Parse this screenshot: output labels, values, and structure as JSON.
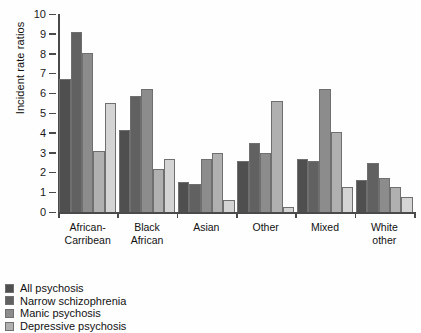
{
  "chart_data": {
    "type": "bar",
    "title": "",
    "subtitle": "",
    "xlabel": "",
    "ylabel": "Incident rate ratios",
    "ylim": [
      0,
      10
    ],
    "ytick_labels": [
      "0",
      "1",
      "2",
      "3",
      "4",
      "5",
      "6",
      "7",
      "8",
      "9",
      "10"
    ],
    "ytick_values": [
      0,
      1,
      2,
      3,
      4,
      5,
      6,
      7,
      8,
      9,
      10
    ],
    "grid": false,
    "legend_position": "below-left",
    "categories": [
      "African-\nCarribean",
      "Black\nAfrican",
      "Asian",
      "Other",
      "Mixed",
      "White\nother"
    ],
    "series": [
      {
        "name": "All psychosis",
        "color": "#4f4f4f",
        "values": [
          6.7,
          4.15,
          1.5,
          2.6,
          2.7,
          1.6
        ]
      },
      {
        "name": "Narrow schizophrenia",
        "color": "#616161",
        "values": [
          9.1,
          5.85,
          1.4,
          3.5,
          2.6,
          2.5
        ]
      },
      {
        "name": "Manic psychosis",
        "color": "#8c8c8c",
        "values": [
          8.05,
          6.2,
          2.7,
          3.0,
          6.2,
          1.7
        ]
      },
      {
        "name": "Depressive psychosis",
        "color": "#b0b0b0",
        "values": [
          3.1,
          2.15,
          3.0,
          5.6,
          4.05,
          1.25
        ]
      },
      {
        "name": "",
        "color": "#d4d4d4",
        "values": [
          5.5,
          2.7,
          0.6,
          0.25,
          1.25,
          0.75
        ]
      }
    ]
  },
  "legend": {
    "items": [
      {
        "label": "All psychosis",
        "color": "#4f4f4f"
      },
      {
        "label": "Narrow schizophrenia",
        "color": "#616161"
      },
      {
        "label": "Manic psychosis",
        "color": "#8c8c8c"
      },
      {
        "label": "Depressive psychosis",
        "color": "#b0b0b0"
      }
    ]
  }
}
